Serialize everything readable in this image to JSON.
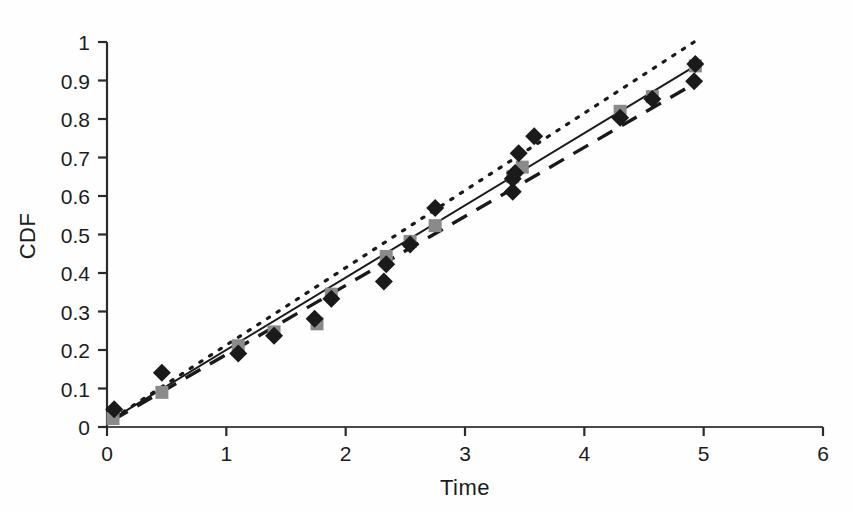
{
  "chart_data": {
    "type": "scatter",
    "title": "",
    "xlabel": "Time",
    "ylabel": "CDF",
    "xlim": [
      0,
      6
    ],
    "ylim": [
      0,
      1
    ],
    "xticks": [
      "0",
      "1",
      "2",
      "3",
      "4",
      "5",
      "6"
    ],
    "xtick_values": [
      0,
      1,
      2,
      3,
      4,
      5,
      6
    ],
    "yticks": [
      "0",
      "0.1",
      "0.2",
      "0.3",
      "0.4",
      "0.5",
      "0.6",
      "0.7",
      "0.8",
      "0.9",
      "1"
    ],
    "ytick_values": [
      0,
      0.1,
      0.2,
      0.3,
      0.4,
      0.5,
      0.6,
      0.7,
      0.8,
      0.9,
      1.0
    ],
    "grid": false,
    "legend": "none",
    "marker_shape": "diamond",
    "series": [
      {
        "name": "observed-data-points",
        "style": "scatter",
        "marker": "diamond",
        "color": "#1a1a1a",
        "points": [
          [
            0.06,
            0.046
          ],
          [
            0.46,
            0.141
          ],
          [
            1.1,
            0.191
          ],
          [
            1.4,
            0.237
          ],
          [
            1.74,
            0.281
          ],
          [
            1.88,
            0.333
          ],
          [
            2.32,
            0.378
          ],
          [
            2.34,
            0.423
          ],
          [
            2.54,
            0.474
          ],
          [
            2.75,
            0.569
          ],
          [
            3.4,
            0.611
          ],
          [
            3.4,
            0.645
          ],
          [
            3.42,
            0.66
          ],
          [
            3.45,
            0.711
          ],
          [
            3.58,
            0.755
          ],
          [
            4.3,
            0.803
          ],
          [
            4.57,
            0.852
          ],
          [
            4.92,
            0.898
          ],
          [
            4.93,
            0.943
          ]
        ]
      },
      {
        "name": "fitted-model-markers",
        "style": "scatter",
        "marker": "square",
        "color": "#8a8a8a",
        "points": [
          [
            0.05,
            0.022
          ],
          [
            0.46,
            0.09
          ],
          [
            1.1,
            0.211
          ],
          [
            1.4,
            0.247
          ],
          [
            1.76,
            0.268
          ],
          [
            1.88,
            0.345
          ],
          [
            2.34,
            0.443
          ],
          [
            2.54,
            0.482
          ],
          [
            2.75,
            0.523
          ],
          [
            3.4,
            0.65
          ],
          [
            3.48,
            0.675
          ],
          [
            4.3,
            0.82
          ],
          [
            4.57,
            0.858
          ],
          [
            4.93,
            0.938
          ]
        ]
      },
      {
        "name": "upper-confidence-bound",
        "style": "dotted",
        "color": "#1a1a1a",
        "line": [
          [
            0.05,
            0.022
          ],
          [
            4.92,
            1.0
          ]
        ]
      },
      {
        "name": "fitted-line",
        "style": "solid",
        "color": "#1a1a1a",
        "line": [
          [
            0.05,
            0.022
          ],
          [
            4.93,
            0.938
          ]
        ]
      },
      {
        "name": "lower-confidence-bound",
        "style": "dashed",
        "color": "#1a1a1a",
        "line": [
          [
            0.05,
            0.018
          ],
          [
            4.94,
            0.895
          ]
        ]
      }
    ]
  },
  "axes": {
    "x_label": "Time",
    "y_label": "CDF"
  }
}
